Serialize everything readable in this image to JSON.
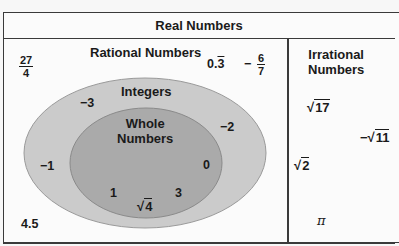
{
  "diagram": {
    "title": "Real Numbers",
    "sections": {
      "rational": {
        "label": "Rational Numbers"
      },
      "irrational": {
        "label_line1": "Irrational",
        "label_line2": "Numbers"
      },
      "integers": {
        "label": "Integers"
      },
      "whole": {
        "label_line1": "Whole",
        "label_line2": "Numbers"
      }
    },
    "rational_only": {
      "frac_27_4": {
        "numerator": "27",
        "denominator": "4"
      },
      "repeating": {
        "whole": "0.",
        "repeat": "3"
      },
      "neg_frac": {
        "sign": "−",
        "numerator": "6",
        "denominator": "7"
      },
      "decimal": "4.5"
    },
    "integers_only": [
      "−3",
      "−2",
      "−1"
    ],
    "whole_numbers": {
      "zero": "0",
      "one": "1",
      "three": "3",
      "sqrt4": {
        "symbol": "√",
        "radicand": "4"
      }
    },
    "irrational_numbers": {
      "sqrt17": {
        "symbol": "√",
        "radicand": "17"
      },
      "neg_sqrt11": {
        "sign": "−",
        "symbol": "√",
        "radicand": "11"
      },
      "sqrt2": {
        "symbol": "√",
        "radicand": "2"
      },
      "pi": "π"
    },
    "colors": {
      "integers_fill": "#cbcbcb",
      "whole_fill": "#aaaaaa",
      "border": "#3a3a3a"
    }
  }
}
